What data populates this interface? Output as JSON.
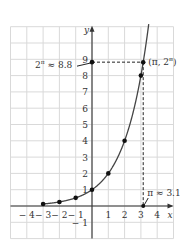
{
  "chart_data": {
    "type": "line",
    "title": "",
    "xlabel": "x",
    "ylabel": "y",
    "xlim": [
      -5,
      5
    ],
    "ylim": [
      -2,
      12
    ],
    "grid": true,
    "function": "y = 2^x",
    "x_ticks": [
      "-4",
      "-3",
      "-2",
      "-1",
      "1",
      "2",
      "3",
      "4"
    ],
    "x_tick_values": [
      -4,
      -3,
      -2,
      -1,
      1,
      2,
      3,
      4
    ],
    "y_ticks": [
      "-1",
      "1",
      "2",
      "3",
      "4",
      "5",
      "6",
      "7",
      "8",
      "9"
    ],
    "y_tick_values": [
      -1,
      1,
      2,
      3,
      4,
      5,
      6,
      7,
      8,
      9
    ],
    "series": [
      {
        "name": "2^x",
        "points": [
          {
            "x": -3,
            "y": 0.125
          },
          {
            "x": -2,
            "y": 0.25
          },
          {
            "x": -1,
            "y": 0.5
          },
          {
            "x": 0,
            "y": 1
          },
          {
            "x": 1,
            "y": 2
          },
          {
            "x": 2,
            "y": 4
          },
          {
            "x": 3,
            "y": 8
          },
          {
            "x": 3.14159,
            "y": 8.82
          }
        ]
      }
    ],
    "annotations": [
      {
        "text": "(π, 2^π)",
        "display": "(π, 2π)",
        "x": 3.14159,
        "y": 8.82
      },
      {
        "text": "2^π ≈ 8.8",
        "points_to": {
          "x": 0,
          "y": 8.82
        }
      },
      {
        "text": "π ≈ 3.1",
        "points_to": {
          "x": 3.14159,
          "y": 0
        }
      }
    ]
  },
  "labels": {
    "x_axis": "x",
    "y_axis": "y",
    "point_label": "(π, 2",
    "point_label_sup": "π",
    "point_label_close": ")",
    "y_callout_base": "2",
    "y_callout_sup": "π",
    "y_callout_rest": " ≈ 8.8",
    "x_callout": "π ≈ 3.1"
  },
  "colors": {
    "grid": "#d9d9d9",
    "axis": "#333333",
    "curve": "#444444",
    "point": "#111111"
  }
}
